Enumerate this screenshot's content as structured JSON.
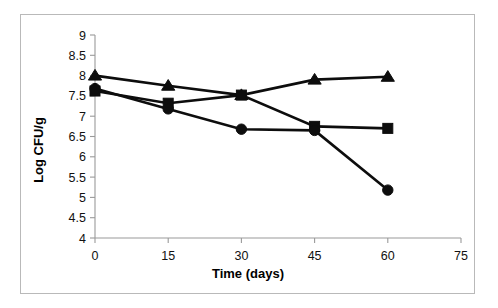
{
  "chart_data": {
    "type": "line",
    "title": "",
    "subtitle": "",
    "xlabel": "Time (days)",
    "ylabel": "Log CFU/g",
    "x": [
      0,
      15,
      30,
      45,
      60
    ],
    "xlim": [
      0,
      75
    ],
    "ylim": [
      4,
      9
    ],
    "xticks": [
      "0",
      "15",
      "30",
      "45",
      "60",
      "75"
    ],
    "xtick_values": [
      0,
      15,
      30,
      45,
      60,
      75
    ],
    "yticks": [
      "4",
      "4.5",
      "5",
      "5.5",
      "6",
      "6.5",
      "7",
      "7.5",
      "8",
      "8.5",
      "9"
    ],
    "ytick_values": [
      4,
      4.5,
      5,
      5.5,
      6,
      6.5,
      7,
      7.5,
      8,
      8.5,
      9
    ],
    "grid": false,
    "legend": "none",
    "series": [
      {
        "name": "triangle-series",
        "marker": "triangle",
        "color": "#0d0d0d",
        "values": [
          8.0,
          7.75,
          7.52,
          7.9,
          7.97
        ]
      },
      {
        "name": "square-series",
        "marker": "square",
        "color": "#0d0d0d",
        "values": [
          7.62,
          7.32,
          7.52,
          6.75,
          6.7
        ]
      },
      {
        "name": "circle-series",
        "marker": "circle",
        "color": "#0d0d0d",
        "values": [
          7.68,
          7.18,
          6.68,
          6.65,
          5.18
        ]
      }
    ]
  },
  "figure": {
    "border_color": "#b9b9b9",
    "background": "#ffffff",
    "axis_color": "#9a9a9a",
    "ink_color": "#0d0d0d"
  }
}
